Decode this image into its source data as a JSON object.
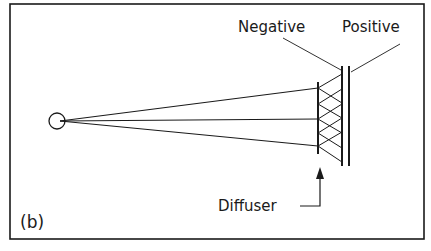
{
  "figure": {
    "panel_label": "(b)",
    "labels": {
      "negative": "Negative",
      "positive": "Positive",
      "diffuser": "Diffuser"
    },
    "colors": {
      "ink": "#1a1a1a",
      "background": "#ffffff"
    }
  }
}
